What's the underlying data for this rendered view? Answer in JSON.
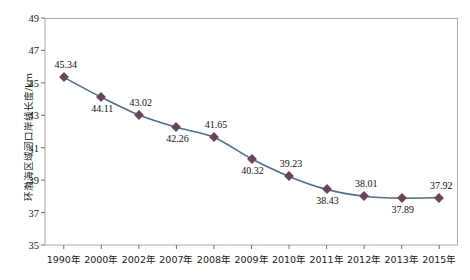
{
  "chart_data": {
    "type": "line",
    "title": "",
    "xlabel": "",
    "ylabel": "环渤海区域河口岸线长度/km",
    "categories": [
      "1990年",
      "2000年",
      "2002年",
      "2007年",
      "2008年",
      "2009年",
      "2010年",
      "2011年",
      "2012年",
      "2013年",
      "2015年"
    ],
    "values": [
      45.34,
      44.11,
      43.02,
      42.26,
      41.65,
      40.32,
      39.23,
      38.43,
      38.01,
      37.89,
      37.92
    ],
    "value_labels": [
      "45.34",
      "44.11",
      "43.02",
      "42.26",
      "41.65",
      "40.32",
      "39.23",
      "38.43",
      "38.01",
      "37.89",
      "37.92"
    ],
    "label_positions": [
      "above",
      "below",
      "above",
      "below",
      "above",
      "below",
      "above",
      "below",
      "above",
      "below",
      "above"
    ],
    "ylim": [
      35,
      49
    ],
    "yticks": [
      35,
      37,
      39,
      41,
      43,
      45,
      47,
      49
    ],
    "ytick_labels": [
      "35",
      "37",
      "39",
      "41",
      "43",
      "45",
      "47",
      "49"
    ],
    "grid": false,
    "legend": "none",
    "series_name": "环渤海区域河口岸线长度",
    "line_color": "#4a6f94",
    "marker_color": "#6b4557",
    "axis_color": "#a8a8a8",
    "background": "#ffffff"
  }
}
